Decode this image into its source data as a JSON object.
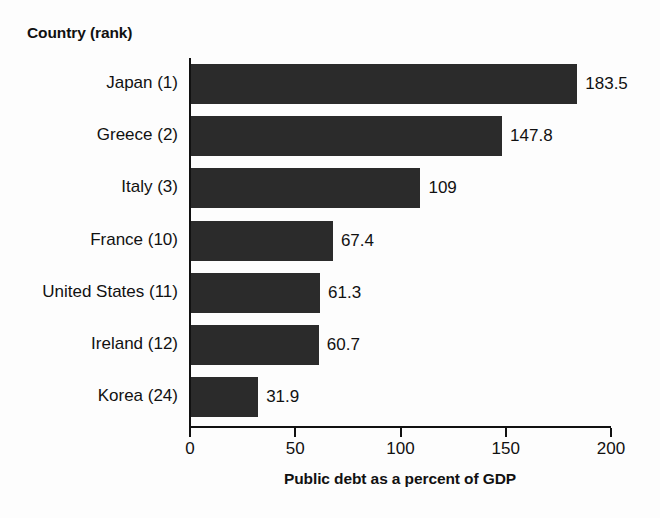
{
  "chart_data": {
    "type": "bar",
    "orientation": "horizontal",
    "title": "",
    "categories": [
      "Japan (1)",
      "Greece (2)",
      "Italy (3)",
      "France (10)",
      "United States (11)",
      "Ireland (12)",
      "Korea (24)"
    ],
    "values": [
      183.5,
      147.8,
      109,
      67.4,
      61.3,
      60.7,
      31.9
    ],
    "value_labels": [
      "183.5",
      "147.8",
      "109",
      "67.4",
      "61.3",
      "60.7",
      "31.9"
    ],
    "xlabel": "Public debt as a percent of GDP",
    "ylabel": "Country (rank)",
    "xlim": [
      0,
      200
    ],
    "xticks": [
      0,
      50,
      100,
      150,
      200
    ],
    "xtick_labels": [
      "0",
      "50",
      "100",
      "150",
      "200"
    ],
    "grid": false,
    "legend": null,
    "bar_color": "#2b2b2b",
    "background_color": "#fdfdfd",
    "axis_color": "#111111"
  }
}
